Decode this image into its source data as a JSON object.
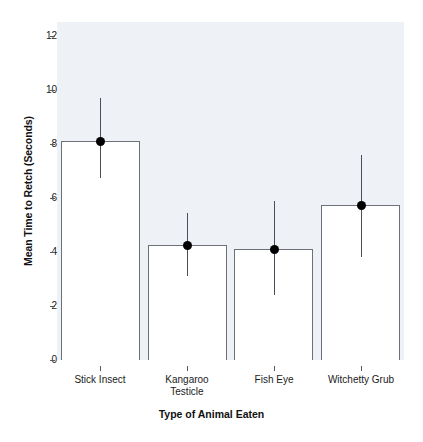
{
  "chart_data": {
    "type": "bar",
    "title": "",
    "subtitle": "",
    "xlabel": "Type of Animal Eaten",
    "ylabel": "Mean Time to Retch (Seconds)",
    "categories": [
      "Stick Insect",
      "Kangaroo Testicle",
      "Fish Eye",
      "Witchetty Grub"
    ],
    "category_lines": [
      [
        "Stick Insect"
      ],
      [
        "Kangaroo",
        "Testicle"
      ],
      [
        "Fish Eye"
      ],
      [
        "Witchetty Grub"
      ]
    ],
    "values": [
      8.1,
      4.25,
      4.1,
      5.75
    ],
    "error_low": [
      6.75,
      3.1,
      2.4,
      3.8
    ],
    "error_high": [
      9.7,
      5.45,
      5.9,
      7.6
    ],
    "point_values": [
      8.1,
      4.25,
      4.1,
      5.75
    ],
    "ylim": [
      0,
      12.9
    ],
    "xlim": [
      0,
      4
    ],
    "yticks": [
      0,
      2,
      4,
      6,
      8,
      10,
      12
    ],
    "ytick_labels": [
      "0",
      "2",
      "4",
      "6",
      "8",
      "10",
      "12"
    ],
    "grid": false,
    "legend": null,
    "legend_position": "none",
    "bar_fill_color": "#ffffff",
    "bar_edge_color": "#6b7079",
    "error_color": "#4a4f57",
    "point_color": "#000000",
    "panel_background": "#eef1f6",
    "figure_background": "#ffffff"
  }
}
